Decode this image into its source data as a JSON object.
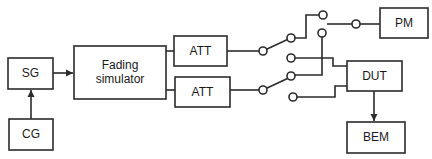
{
  "diagram": {
    "blocks": {
      "sg": {
        "label": "SG"
      },
      "cg": {
        "label": "CG"
      },
      "fading": {
        "label_line1": "Fading",
        "label_line2": "simulator"
      },
      "att1": {
        "label": "ATT"
      },
      "att2": {
        "label": "ATT"
      },
      "pm": {
        "label": "PM"
      },
      "dut": {
        "label": "DUT"
      },
      "bem": {
        "label": "BEM"
      }
    },
    "colors": {
      "stroke": "#2b2b2b",
      "background": "#ffffff",
      "text": "#1a1a1a"
    },
    "connections": [
      {
        "from": "CG",
        "to": "SG",
        "arrow": true
      },
      {
        "from": "SG",
        "to": "Fading simulator",
        "arrow": true
      },
      {
        "from": "Fading simulator",
        "to": "ATT (upper)"
      },
      {
        "from": "Fading simulator",
        "to": "ATT (lower)"
      },
      {
        "from": "ATT (upper)",
        "to": "switch 1"
      },
      {
        "from": "ATT (lower)",
        "to": "switch 2"
      },
      {
        "from": "switch 1",
        "to": "PM / DUT"
      },
      {
        "from": "switch 2",
        "to": "PM / DUT"
      },
      {
        "from": "DUT",
        "to": "BEM",
        "arrow": true
      }
    ]
  }
}
